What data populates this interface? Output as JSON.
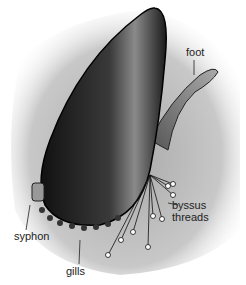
{
  "figure": {
    "labels": {
      "foot": "foot",
      "byssus_line1": "byssus",
      "byssus_line2": "threads",
      "syphon": "syphon",
      "gills": "gills"
    }
  }
}
